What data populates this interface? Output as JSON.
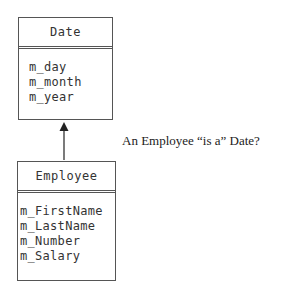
{
  "diagram": {
    "type": "uml-class-inheritance",
    "parent_class": {
      "name": "Date",
      "attributes": [
        "m_day",
        "m_month",
        "m_year"
      ]
    },
    "child_class": {
      "name": "Employee",
      "attributes": [
        "m_FirstName",
        "m_LastName",
        "m_Number",
        "m_Salary"
      ]
    },
    "relationship": {
      "from": "Employee",
      "to": "Date",
      "kind": "is-a arrow"
    },
    "caption": "An Employee “is a” Date?",
    "colors": {
      "line": "#555555",
      "text": "#333333",
      "background": "#ffffff"
    }
  }
}
